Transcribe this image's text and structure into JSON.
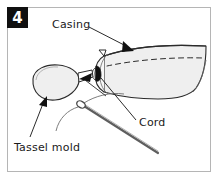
{
  "figure": {
    "step_badge": "4",
    "frame_color": "#b5b5b5",
    "background_color": "#ffffff",
    "ink_color": "#1a1a1a",
    "fill_color": "#efefef",
    "labels": [
      {
        "id": "casing",
        "text": "Casing"
      },
      {
        "id": "cord",
        "text": "Cord"
      },
      {
        "id": "tassel_mold",
        "text": "Tassel mold"
      }
    ],
    "parts": [
      {
        "id": "casing-tube",
        "name": "fabric casing tube"
      },
      {
        "id": "casing-stitch-line",
        "name": "dashed stitching line"
      },
      {
        "id": "casing-opening",
        "name": "casing end opening"
      },
      {
        "id": "tassel-mold-body",
        "name": "tassel mold oval"
      },
      {
        "id": "cord-end",
        "name": "cord end inside casing"
      },
      {
        "id": "needle",
        "name": "threaded needle"
      },
      {
        "id": "thread",
        "name": "thread"
      }
    ],
    "arrows": [
      {
        "id": "casing-arrow",
        "points_to": "casing-tube"
      },
      {
        "id": "cord-arrow",
        "points_to": "cord-end"
      },
      {
        "id": "tassel-arrow",
        "points_to": "tassel-mold-body"
      }
    ]
  }
}
